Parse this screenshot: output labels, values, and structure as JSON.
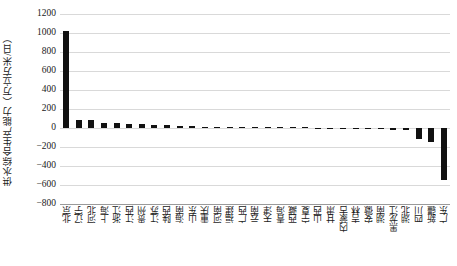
{
  "chart_data": {
    "type": "bar",
    "title": "",
    "xlabel": "",
    "ylabel": "供水综合生产能力（万立方米/日）",
    "ylim": [
      -800,
      1200
    ],
    "ytick_step": 200,
    "yticks": [
      "1200",
      "1000",
      "800",
      "600",
      "400",
      "200",
      "0",
      "-200",
      "-400",
      "-600",
      "-800"
    ],
    "grid": "horizontal",
    "legend": "none",
    "bar_color": "#111111",
    "gridline_color": "#d9d9d9",
    "categories": [
      "北京",
      "辽宁",
      "河北",
      "上海",
      "浙江",
      "江西",
      "贵州",
      "江苏",
      "陕西",
      "海南",
      "山东",
      "重庆",
      "河南",
      "福建",
      "广西",
      "云南",
      "天津",
      "青海",
      "西藏",
      "宁夏",
      "山西",
      "甘肃",
      "内蒙古",
      "吉林",
      "安徽",
      "湖南",
      "黑龙江",
      "湖北",
      "四川",
      "新疆",
      "广东"
    ],
    "values": [
      1020,
      85,
      80,
      56,
      52,
      40,
      38,
      36,
      28,
      26,
      24,
      13,
      11,
      9,
      7,
      5,
      3,
      2,
      1,
      0,
      -1,
      -3,
      -5,
      -8,
      -10,
      -14,
      -20,
      -26,
      -112,
      -152,
      -548
    ]
  }
}
